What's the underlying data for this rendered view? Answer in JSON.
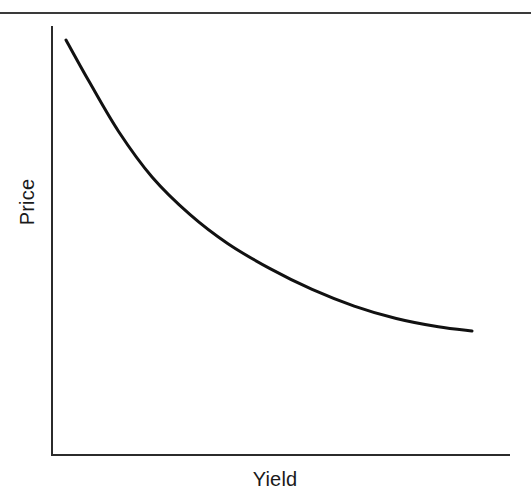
{
  "figure": {
    "name": "price-yield-curve",
    "top_rule_visible": true
  },
  "chart_data": {
    "type": "line",
    "title": "",
    "subtitle": "",
    "xlabel": "Yield",
    "ylabel": "Price",
    "grid": false,
    "legend": false,
    "legend_position": "none",
    "axes": {
      "x_ticks": [],
      "y_ticks": [],
      "x_tick_labels": [],
      "y_tick_labels": [],
      "xlim": [
        0,
        100
      ],
      "ylim": [
        0,
        100
      ],
      "axis_color": "#2b2b2b",
      "spines": [
        "left",
        "bottom"
      ]
    },
    "annotations": [],
    "series": [
      {
        "name": "Price vs Yield",
        "color": "#111111",
        "line_width": 3,
        "x": [
          3.5,
          9,
          16,
          24,
          33,
          42,
          52,
          62,
          72,
          82,
          92,
          100
        ],
        "y": [
          96.5,
          86.5,
          74.5,
          63.5,
          54.5,
          47.5,
          41.5,
          36.5,
          32.5,
          29.5,
          27.5,
          26.5
        ]
      }
    ]
  }
}
